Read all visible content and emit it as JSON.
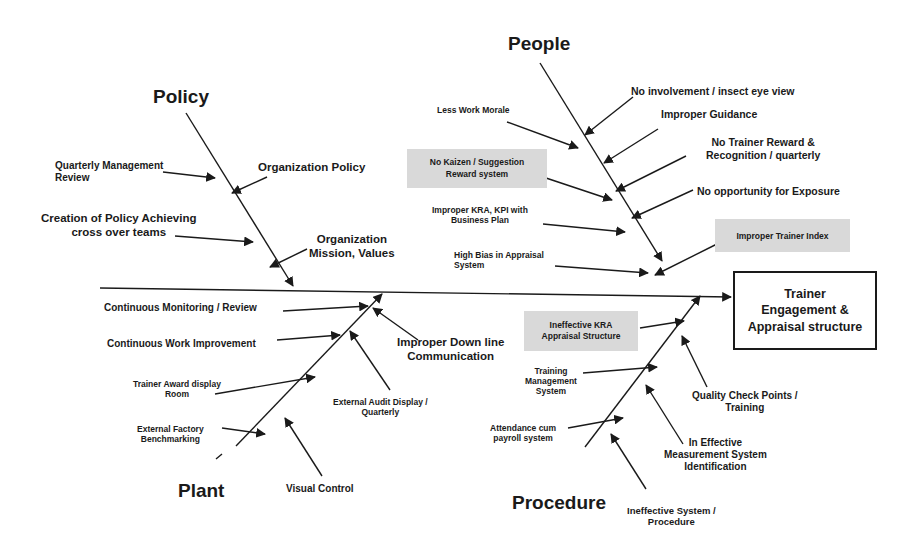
{
  "diagram": {
    "type": "fishbone",
    "effect": "Trainer Engagement & Appraisal structure",
    "categories": {
      "policy": {
        "label": "Policy",
        "causes": [
          "Quarterly Management Review",
          "Organization Policy",
          "Creation of Policy Achieving cross over teams",
          "Organization Mission, Values"
        ]
      },
      "people": {
        "label": "People",
        "causes": [
          "No involvement / insect eye view",
          "Less Work Morale",
          "Improper Guidance",
          "No Trainer Reward & Recognition / quarterly",
          "No Kaizen / Suggestion Reward system",
          "No opportunity for Exposure",
          "Improper KRA, KPI with Business Plan",
          "Improper Trainer Index",
          "High Bias in Appraisal System"
        ]
      },
      "plant": {
        "label": "Plant",
        "causes": [
          "Continuous Monitoring / Review",
          "Continuous Work Improvement",
          "Improper Down line Communication",
          "Trainer Award display Room",
          "External Audit Display / Quarterly",
          "External Factory Benchmarking",
          "Visual Control"
        ]
      },
      "procedure": {
        "label": "Procedure",
        "causes": [
          "Ineffective KRA Appraisal Structure",
          "Training Management System",
          "Quality Check Points / Training",
          "Attendance cum payroll system",
          "In Effective Measurement System Identification",
          "Ineffective System / Procedure"
        ]
      }
    },
    "labels": {
      "policy": "Policy",
      "people": "People",
      "plant": "Plant",
      "procedure": "Procedure",
      "effect_line1": "Trainer",
      "effect_line2": "Engagement &",
      "effect_line3": "Appraisal structure",
      "qmr_1": "Quarterly Management",
      "qmr_2": "Review",
      "org_policy": "Organization Policy",
      "creation_1": "Creation of Policy Achieving",
      "creation_2": "cross over teams",
      "mission_1": "Organization",
      "mission_2": "Mission, Values",
      "no_involvement": "No involvement / insect eye view",
      "less_morale": "Less Work Morale",
      "improper_guidance": "Improper Guidance",
      "no_reward_1": "No Trainer Reward &",
      "no_reward_2": "Recognition / quarterly",
      "kaizen_1": "No Kaizen / Suggestion",
      "kaizen_2": "Reward system",
      "no_exposure": "No opportunity for Exposure",
      "kra_kpi_1": "Improper KRA, KPI with",
      "kra_kpi_2": "Business Plan",
      "trainer_index": "Improper Trainer Index",
      "bias_1": "High Bias in Appraisal",
      "bias_2": "System",
      "monitoring": "Continuous Monitoring / Review",
      "work_improvement": "Continuous Work Improvement",
      "downline_1": "Improper Down line",
      "downline_2": "Communication",
      "award_1": "Trainer Award display",
      "award_2": "Room",
      "audit_1": "External Audit Display /",
      "audit_2": "Quarterly",
      "benchmark_1": "External Factory",
      "benchmark_2": "Benchmarking",
      "visual_control": "Visual Control",
      "ineff_kra_1": "Ineffective KRA",
      "ineff_kra_2": "Appraisal Structure",
      "tms_1": "Training",
      "tms_2": "Management",
      "tms_3": "System",
      "quality_1": "Quality Check Points /",
      "quality_2": "Training",
      "attendance_1": "Attendance cum",
      "attendance_2": "payroll system",
      "measurement_1": "In Effective",
      "measurement_2": "Measurement System",
      "measurement_3": "Identification",
      "ineff_sys_1": "Ineffective System /",
      "ineff_sys_2": "Procedure"
    },
    "colors": {
      "line": "#1a1a1a",
      "box_fill": "#d9d9d9",
      "background": "#ffffff"
    }
  }
}
